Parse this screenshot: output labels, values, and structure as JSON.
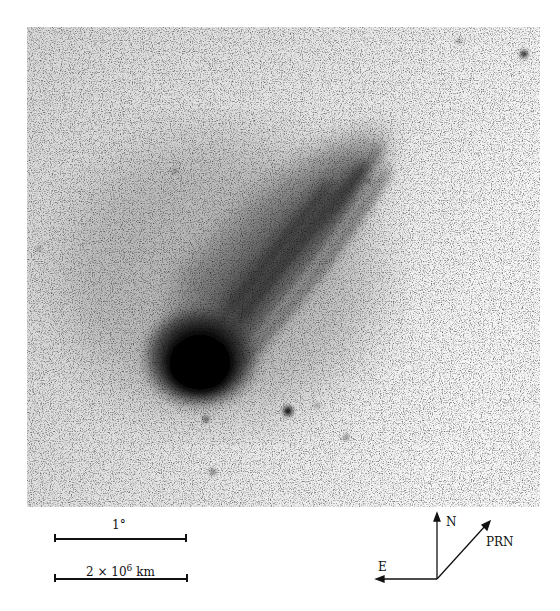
{
  "figure": {
    "photo": {
      "background_color": "#e9e9e9",
      "nucleus_color": "#050505",
      "nucleus_center": [
        200,
        365
      ],
      "tail_direction": "up-right",
      "notable_stars": [
        [
          288,
          411
        ],
        [
          524,
          54
        ],
        [
          206,
          419
        ],
        [
          213,
          472
        ]
      ]
    },
    "scale_bars": [
      {
        "label": "1°"
      },
      {
        "label": "2 × 10",
        "sup": "6",
        "unit": " km"
      }
    ],
    "compass": {
      "north": "N",
      "east": "E",
      "prn": "PRN"
    }
  }
}
